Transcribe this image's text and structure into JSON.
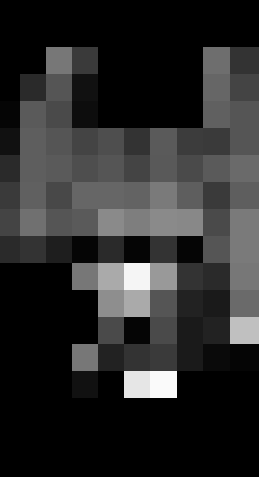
{
  "image": {
    "description": "Low-resolution pixelated grayscale image on black background",
    "width": 259,
    "height": 477,
    "background": "#000000",
    "border_color": "#ffffff"
  },
  "grid": {
    "col_edges": [
      0,
      20,
      46,
      72,
      98,
      124,
      150,
      177,
      203,
      230,
      259
    ],
    "row_edges": [
      0,
      20,
      47,
      74,
      101,
      128,
      155,
      182,
      209,
      236,
      263,
      290,
      317,
      344,
      371,
      398,
      477
    ],
    "rows": [
      [
        "#000000",
        "#000000",
        "#000000",
        "#000000",
        "#000000",
        "#000000",
        "#000000",
        "#000000",
        "#000000",
        "#000000"
      ],
      [
        "#000000",
        "#000000",
        "#000000",
        "#000000",
        "#000000",
        "#000000",
        "#000000",
        "#000000",
        "#000000",
        "#000000"
      ],
      [
        "#000000",
        "#000000",
        "#777777",
        "#3a3a3a",
        "#000000",
        "#000000",
        "#000000",
        "#000000",
        "#6e6e6e",
        "#333333"
      ],
      [
        "#000000",
        "#2a2a2a",
        "#555555",
        "#111111",
        "#000000",
        "#000000",
        "#000000",
        "#000000",
        "#666666",
        "#444444"
      ],
      [
        "#050505",
        "#5a5a5a",
        "#4a4a4a",
        "#0d0d0d",
        "#000000",
        "#000000",
        "#000000",
        "#000000",
        "#606060",
        "#555555"
      ],
      [
        "#111111",
        "#5e5e5e",
        "#555555",
        "#444444",
        "#4e4e4e",
        "#333333",
        "#5a5a5a",
        "#3c3c3c",
        "#3a3a3a",
        "#555555"
      ],
      [
        "#2a2a2a",
        "#5e5e5e",
        "#5a5a5a",
        "#4e4e4e",
        "#555555",
        "#444444",
        "#595959",
        "#4a4a4a",
        "#5a5a5a",
        "#6a6a6a"
      ],
      [
        "#3a3a3a",
        "#606060",
        "#484848",
        "#666666",
        "#666666",
        "#636363",
        "#7a7a7a",
        "#5e5e5e",
        "#3a3a3a",
        "#5e5e5e"
      ],
      [
        "#444444",
        "#707070",
        "#555555",
        "#5a5a5a",
        "#8a8a8a",
        "#7e7e7e",
        "#8a8a8a",
        "#888888",
        "#4a4a4a",
        "#7a7a7a"
      ],
      [
        "#2a2a2a",
        "#333333",
        "#1e1e1e",
        "#050505",
        "#2a2a2a",
        "#050505",
        "#333333",
        "#050505",
        "#555555",
        "#7a7a7a"
      ],
      [
        "#000000",
        "#000000",
        "#000000",
        "#777777",
        "#aaaaaa",
        "#f5f5f5",
        "#999999",
        "#333333",
        "#2a2a2a",
        "#777777"
      ],
      [
        "#000000",
        "#000000",
        "#000000",
        "#000000",
        "#8e8e8e",
        "#aaaaaa",
        "#555555",
        "#222222",
        "#1a1a1a",
        "#6a6a6a"
      ],
      [
        "#000000",
        "#000000",
        "#000000",
        "#000000",
        "#4a4a4a",
        "#050505",
        "#4a4a4a",
        "#1a1a1a",
        "#222222",
        "#c0c0c0"
      ],
      [
        "#000000",
        "#000000",
        "#000000",
        "#777777",
        "#222222",
        "#333333",
        "#3a3a3a",
        "#1a1a1a",
        "#0a0a0a",
        "#050505"
      ],
      [
        "#000000",
        "#000000",
        "#000000",
        "#111111",
        "#000000",
        "#e6e6e6",
        "#fafafa",
        "#000000",
        "#000000",
        "#000000"
      ],
      [
        "#000000",
        "#000000",
        "#000000",
        "#000000",
        "#000000",
        "#000000",
        "#000000",
        "#000000",
        "#000000",
        "#000000"
      ]
    ]
  }
}
